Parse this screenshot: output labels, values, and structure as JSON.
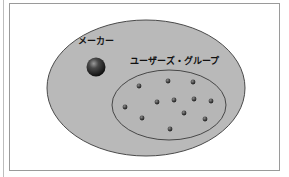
{
  "diagram": {
    "type": "venn-set-diagram",
    "outer_set": {
      "fill": "#b9b9b9",
      "stroke": "#4a4a4a"
    },
    "inner_set": {
      "label": "ユーザーズ・グループ",
      "fill": "#b5b5b5",
      "stroke": "#3a3a3a",
      "member_count": 12
    },
    "maker": {
      "label": "メーカー",
      "color": "#2a2a2a"
    },
    "members": [
      {
        "x": 139,
        "y": 86
      },
      {
        "x": 168,
        "y": 81
      },
      {
        "x": 193,
        "y": 82
      },
      {
        "x": 125,
        "y": 107
      },
      {
        "x": 157,
        "y": 102
      },
      {
        "x": 174,
        "y": 100
      },
      {
        "x": 194,
        "y": 99
      },
      {
        "x": 211,
        "y": 101
      },
      {
        "x": 142,
        "y": 118
      },
      {
        "x": 184,
        "y": 113
      },
      {
        "x": 205,
        "y": 119
      },
      {
        "x": 170,
        "y": 129
      }
    ]
  }
}
